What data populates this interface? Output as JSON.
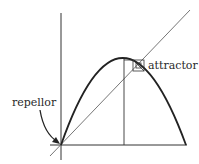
{
  "diagram": {
    "labels": {
      "attractor": "attractor",
      "repellor": "repellor"
    },
    "colors": {
      "curve": "#222222",
      "axes": "#333333",
      "diagonal": "#555555",
      "background": "#ffffff"
    },
    "elements": {
      "y_axis": {
        "x": 61,
        "y1": 13,
        "y2": 160
      },
      "x_axis": {
        "y": 145,
        "x1": 50,
        "x2": 187
      },
      "parabola": {
        "start": [
          61,
          145
        ],
        "peak": [
          122,
          58
        ],
        "end": [
          186,
          145
        ]
      },
      "diagonal": {
        "from": [
          50,
          156
        ],
        "to": [
          190,
          10
        ]
      },
      "vertical_line": {
        "x": 124,
        "y1": 58,
        "y2": 145
      },
      "attractor_box": {
        "x": 133,
        "y": 60,
        "w": 11,
        "h": 11
      }
    }
  }
}
